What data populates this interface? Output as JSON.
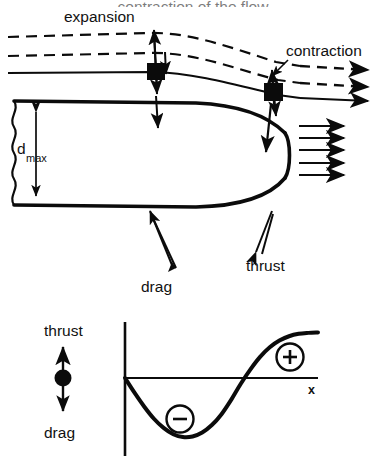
{
  "figure": {
    "type": "technical-diagram"
  },
  "top_clipped_caption": {
    "text": "contraction of the flow",
    "note": "clipped by the top edge of the screenshot, only the bottom sliver of the glyphs is visible"
  },
  "upper_diagram": {
    "labels": {
      "expansion": "expansion",
      "contraction": "contraction",
      "d_max_symbol": "d",
      "d_max_subscript": "max",
      "drag": "drag",
      "thrust": "thrust"
    },
    "streamlines": [
      {
        "name": "upper-dashed-streamline",
        "style": "dashed"
      },
      {
        "name": "middle-dashed-streamline",
        "style": "dashed"
      },
      {
        "name": "solid-streamline",
        "style": "solid"
      }
    ],
    "foils": [
      {
        "name": "forward-foil",
        "marker": "black-square",
        "motion": "vertical-double-arrow"
      },
      {
        "name": "aft-foil",
        "marker": "black-square",
        "motion": "vertical-double-arrow"
      }
    ],
    "wake_arrow_count": 5,
    "outflow_arrow_count": 3
  },
  "legend": {
    "thrust_label": "thrust",
    "drag_label": "drag",
    "marker": "filled-circle-with-double-arrow",
    "up_means": "thrust",
    "down_means": "drag"
  },
  "chart_data": {
    "type": "line",
    "title": "",
    "xlabel": "x",
    "ylabel": "",
    "grid": false,
    "legend": "none",
    "axis_label_x": "x",
    "annotations": [
      {
        "text": "−",
        "label": "minus",
        "meaning": "drag region",
        "x": 0.33,
        "y": -0.45
      },
      {
        "text": "+",
        "label": "plus",
        "meaning": "thrust region",
        "x": 0.82,
        "y": 0.55
      }
    ],
    "xlim": [
      0,
      1
    ],
    "ylim": [
      -1.15,
      1.0
    ],
    "x": [
      0.0,
      0.05,
      0.1,
      0.15,
      0.2,
      0.25,
      0.3,
      0.35,
      0.4,
      0.45,
      0.5,
      0.55,
      0.6,
      0.65,
      0.7,
      0.75,
      0.8,
      0.85,
      0.9,
      0.95,
      1.0
    ],
    "y": [
      0.0,
      -0.26,
      -0.5,
      -0.71,
      -0.87,
      -0.98,
      -1.03,
      -1.02,
      -0.95,
      -0.82,
      -0.63,
      -0.38,
      -0.1,
      0.18,
      0.44,
      0.64,
      0.78,
      0.87,
      0.92,
      0.94,
      0.95
    ],
    "series": [
      {
        "name": "thrust-minus-drag",
        "values": [
          0.0,
          -0.26,
          -0.5,
          -0.71,
          -0.87,
          -0.98,
          -1.03,
          -1.02,
          -0.95,
          -0.82,
          -0.63,
          -0.38,
          -0.1,
          0.18,
          0.44,
          0.64,
          0.78,
          0.87,
          0.92,
          0.94,
          0.95
        ]
      }
    ],
    "zero_crossings": [
      0.0,
      0.635
    ]
  },
  "colors": {
    "ink": "#0b0b0b",
    "paper": "#ffffff"
  }
}
